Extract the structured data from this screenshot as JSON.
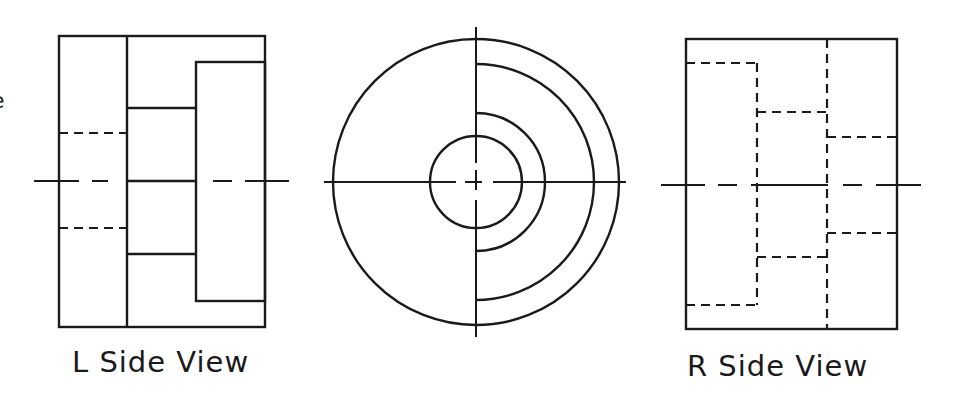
{
  "drawing": {
    "stroke_color": "#1a1a1a",
    "background": "#ffffff",
    "solid_width": 2.4,
    "hidden_width": 2.2,
    "center_width": 2.0,
    "hidden_dash": "9 6",
    "center_dash": "45 13 16 13"
  },
  "clipped_edge_glyph": {
    "text": "e",
    "x": -9,
    "y": 90
  },
  "views": [
    {
      "id": "left-side-view",
      "label": "L Side View",
      "label_pos": {
        "x": 72,
        "y": 348
      },
      "solid_rects": [
        {
          "x": 59,
          "y": 36,
          "w": 206,
          "h": 291
        },
        {
          "x": 196,
          "y": 62,
          "w": 69,
          "h": 239
        }
      ],
      "solid_lines": [
        {
          "x1": 127,
          "y1": 36,
          "x2": 127,
          "y2": 327
        },
        {
          "x1": 127,
          "y1": 108,
          "x2": 196,
          "y2": 108
        },
        {
          "x1": 127,
          "y1": 254,
          "x2": 196,
          "y2": 254
        },
        {
          "x1": 127,
          "y1": 181,
          "x2": 196,
          "y2": 181
        }
      ],
      "hidden_lines": [
        {
          "x1": 59,
          "y1": 133,
          "x2": 127,
          "y2": 133
        },
        {
          "x1": 59,
          "y1": 228,
          "x2": 127,
          "y2": 228
        }
      ],
      "center_segments": [
        {
          "x1": 34,
          "y1": 181,
          "x2": 79,
          "y2": 181
        },
        {
          "x1": 92,
          "y1": 181,
          "x2": 108,
          "y2": 181
        },
        {
          "x1": 213,
          "y1": 181,
          "x2": 232,
          "y2": 181
        },
        {
          "x1": 245,
          "y1": 181,
          "x2": 289,
          "y2": 181
        }
      ]
    },
    {
      "id": "front-view",
      "label": "",
      "center": {
        "x": 476,
        "y": 182
      },
      "outer_circle_r": 143,
      "inner_circle_r": 46,
      "right_arcs_r": [
        118,
        69
      ],
      "vertical_axis": {
        "y1": 27,
        "y2": 337
      },
      "horizontal_axis": {
        "x1": 324,
        "x2": 626
      },
      "center_gap": {
        "h_segments": [
          [
            324,
            456
          ],
          [
            465,
            482
          ],
          [
            493,
            626
          ]
        ],
        "v_segments": [
          [
            27,
            163
          ],
          [
            170,
            190
          ],
          [
            200,
            337
          ]
        ]
      }
    },
    {
      "id": "right-side-view",
      "label": "R Side View",
      "label_pos": {
        "x": 687,
        "y": 352
      },
      "solid_rects": [
        {
          "x": 686,
          "y": 39,
          "w": 211,
          "h": 290
        }
      ],
      "solid_lines": [],
      "hidden_lines": [
        {
          "x1": 827,
          "y1": 39,
          "x2": 827,
          "y2": 329
        },
        {
          "x1": 686,
          "y1": 63,
          "x2": 757,
          "y2": 63
        },
        {
          "x1": 757,
          "y1": 63,
          "x2": 757,
          "y2": 305
        },
        {
          "x1": 686,
          "y1": 305,
          "x2": 757,
          "y2": 305
        },
        {
          "x1": 757,
          "y1": 112,
          "x2": 827,
          "y2": 112
        },
        {
          "x1": 757,
          "y1": 257,
          "x2": 827,
          "y2": 257
        },
        {
          "x1": 827,
          "y1": 137,
          "x2": 897,
          "y2": 137
        },
        {
          "x1": 827,
          "y1": 233,
          "x2": 897,
          "y2": 233
        }
      ],
      "center_segments": [
        {
          "x1": 661,
          "y1": 185,
          "x2": 705,
          "y2": 185
        },
        {
          "x1": 718,
          "y1": 185,
          "x2": 737,
          "y2": 185
        },
        {
          "x1": 751,
          "y1": 185,
          "x2": 828,
          "y2": 185
        },
        {
          "x1": 843,
          "y1": 185,
          "x2": 862,
          "y2": 185
        },
        {
          "x1": 876,
          "y1": 185,
          "x2": 921,
          "y2": 185
        }
      ]
    }
  ]
}
